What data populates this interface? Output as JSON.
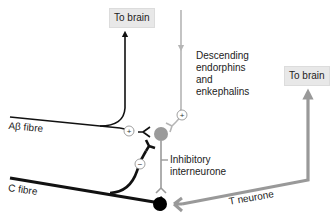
{
  "boxes": {
    "to_brain_left": "To brain",
    "to_brain_right": "To brain"
  },
  "labels": {
    "descending_line1": "Descending",
    "descending_line2": "endorphins",
    "descending_line3": "and",
    "descending_line4": "enkephalins",
    "abeta_fibre": "Aβ fibre",
    "c_fibre": "C fibre",
    "inhibitory_line1": "Inhibitory",
    "inhibitory_line2": "interneurone",
    "t_neurone": "T neurone"
  },
  "synapse_signs": {
    "descending": "+",
    "abeta": "+",
    "c_fibre": "−"
  },
  "colors": {
    "black_pathway": "#111111",
    "grey_pathway": "#9a9a9a",
    "light_grey_pathway": "#b5b5b5",
    "box_fill": "#e8e8e8"
  }
}
